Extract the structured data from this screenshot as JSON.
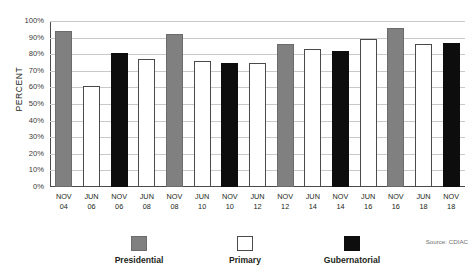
{
  "chart_data": {
    "type": "bar",
    "title": "",
    "subtitle": "",
    "xlabel": "",
    "ylabel": "PERCENT",
    "ylim": [
      0,
      100
    ],
    "grid": true,
    "legend_position": "bottom",
    "y_ticks": [
      "0%",
      "10%",
      "20%",
      "30%",
      "40%",
      "50%",
      "60%",
      "70%",
      "80%",
      "90%",
      "100%"
    ],
    "y_tick_values": [
      0,
      10,
      20,
      30,
      40,
      50,
      60,
      70,
      80,
      90,
      100
    ],
    "categories": [
      "NOV 04",
      "JUN 06",
      "NOV 06",
      "JUN 08",
      "NOV 08",
      "JUN 10",
      "NOV 10",
      "JUN 12",
      "NOV 12",
      "JUN 14",
      "NOV 14",
      "JUN 16",
      "NOV 16",
      "JUN 18",
      "NOV 18"
    ],
    "category_lines": [
      {
        "line1": "NOV",
        "line2": "04"
      },
      {
        "line1": "JUN",
        "line2": "06"
      },
      {
        "line1": "NOV",
        "line2": "06"
      },
      {
        "line1": "JUN",
        "line2": "08"
      },
      {
        "line1": "NOV",
        "line2": "08"
      },
      {
        "line1": "JUN",
        "line2": "10"
      },
      {
        "line1": "NOV",
        "line2": "10"
      },
      {
        "line1": "JUN",
        "line2": "12"
      },
      {
        "line1": "NOV",
        "line2": "12"
      },
      {
        "line1": "JUN",
        "line2": "14"
      },
      {
        "line1": "NOV",
        "line2": "14"
      },
      {
        "line1": "JUN",
        "line2": "16"
      },
      {
        "line1": "NOV",
        "line2": "16"
      },
      {
        "line1": "JUN",
        "line2": "18"
      },
      {
        "line1": "NOV",
        "line2": "18"
      }
    ],
    "values": [
      94,
      61,
      81,
      77,
      92,
      76,
      75,
      75,
      86,
      83,
      82,
      89,
      96,
      86,
      87
    ],
    "bar_types": [
      "presidential",
      "primary",
      "gubernatorial",
      "primary",
      "presidential",
      "primary",
      "gubernatorial",
      "primary",
      "presidential",
      "primary",
      "gubernatorial",
      "primary",
      "presidential",
      "primary",
      "gubernatorial"
    ],
    "series": [
      {
        "name": "Presidential",
        "color": "#808080",
        "values": [
          94,
          null,
          null,
          null,
          92,
          null,
          null,
          null,
          86,
          null,
          null,
          null,
          96,
          null,
          null
        ]
      },
      {
        "name": "Primary",
        "color": "#ffffff",
        "values": [
          null,
          61,
          null,
          77,
          null,
          76,
          null,
          75,
          null,
          83,
          null,
          89,
          null,
          86,
          null
        ]
      },
      {
        "name": "Gubernatorial",
        "color": "#0d0d0d",
        "values": [
          null,
          null,
          81,
          null,
          null,
          null,
          75,
          null,
          null,
          null,
          82,
          null,
          null,
          null,
          87
        ]
      }
    ]
  },
  "legend": {
    "items": [
      {
        "label": "Presidential",
        "type": "presidential",
        "color": "#808080"
      },
      {
        "label": "Primary",
        "type": "primary",
        "color": "#ffffff"
      },
      {
        "label": "Gubernatorial",
        "type": "gubernatorial",
        "color": "#0d0d0d"
      }
    ]
  },
  "source": {
    "text": "Source: CDIAC"
  },
  "colors": {
    "presidential": "#808080",
    "primary": "#ffffff",
    "gubernatorial": "#0d0d0d",
    "gridline": "#c9c9c9",
    "axis": "#4a4a4a",
    "text": "#231f20",
    "background": "#ffffff"
  }
}
